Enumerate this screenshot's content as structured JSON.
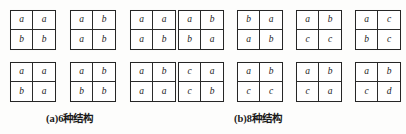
{
  "figure": {
    "cell_symbols": [
      "a",
      "b",
      "c",
      "d"
    ],
    "panels": [
      {
        "id": "a",
        "caption": "(a)6种结构",
        "count_label": "6",
        "rows": [
          {
            "grids": [
              {
                "cells": [
                  "a",
                  "a",
                  "b",
                  "b"
                ]
              },
              {
                "cells": [
                  "a",
                  "b",
                  "a",
                  "b"
                ]
              },
              {
                "cells": [
                  "a",
                  "a",
                  "a",
                  "b"
                ]
              }
            ]
          },
          {
            "grids": [
              {
                "cells": [
                  "a",
                  "a",
                  "b",
                  "a"
                ]
              },
              {
                "cells": [
                  "a",
                  "b",
                  "b",
                  "b"
                ]
              },
              {
                "cells": [
                  "a",
                  "b",
                  "a",
                  "a"
                ]
              }
            ]
          }
        ]
      },
      {
        "id": "b",
        "caption": "(b)8种结构",
        "count_label": "8",
        "rows": [
          {
            "grids": [
              {
                "cells": [
                  "a",
                  "b",
                  "b",
                  "a"
                ]
              },
              {
                "cells": [
                  "b",
                  "a",
                  "a",
                  "b"
                ]
              },
              {
                "cells": [
                  "a",
                  "b",
                  "c",
                  "c"
                ]
              },
              {
                "cells": [
                  "a",
                  "c",
                  "b",
                  "c"
                ]
              }
            ]
          },
          {
            "grids": [
              {
                "cells": [
                  "c",
                  "a",
                  "c",
                  "b"
                ]
              },
              {
                "cells": [
                  "a",
                  "b",
                  "c",
                  "c"
                ]
              },
              {
                "cells": [
                  "a",
                  "b",
                  "c",
                  "a"
                ]
              },
              {
                "cells": [
                  "a",
                  "b",
                  "c",
                  "d"
                ]
              }
            ]
          }
        ]
      }
    ]
  }
}
